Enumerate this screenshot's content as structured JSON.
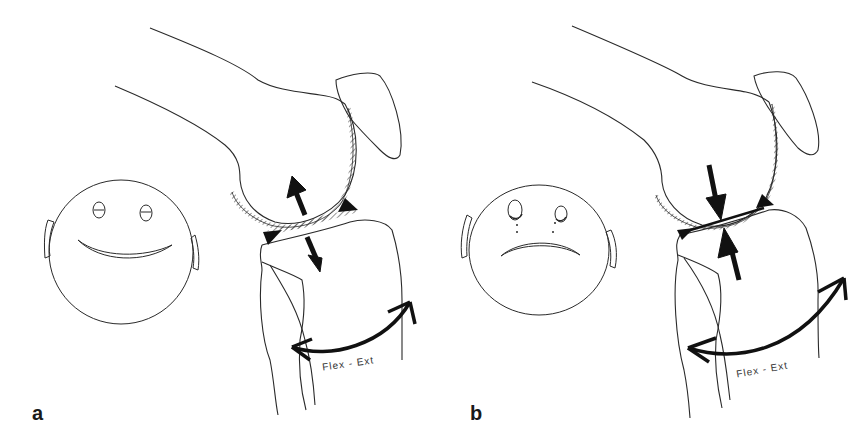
{
  "figure": {
    "panels": [
      {
        "id": "a",
        "label": "a",
        "face": "happy",
        "joint_arrows": "distraction",
        "motion_label": "Flex - Ext"
      },
      {
        "id": "b",
        "label": "b",
        "face": "sad",
        "joint_arrows": "compression",
        "motion_label": "Flex - Ext"
      }
    ],
    "colors": {
      "line": "#2a2a2a",
      "fill": "#111111",
      "background": "#ffffff"
    }
  }
}
